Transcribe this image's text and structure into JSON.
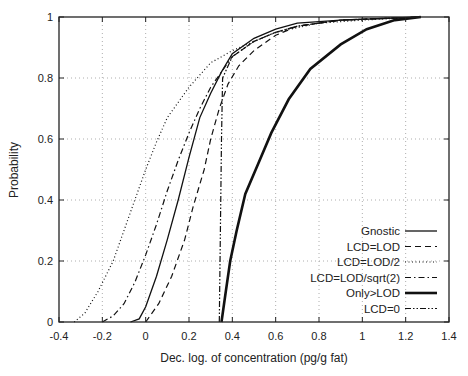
{
  "chart_data": {
    "type": "line",
    "title": "",
    "xlabel": "Dec. log. of concentration (pg/g fat)",
    "ylabel": "Probability",
    "xlim": [
      -0.4,
      1.4
    ],
    "ylim": [
      0,
      1
    ],
    "xticks": [
      "-0.4",
      "-0.2",
      "0",
      "0.2",
      "0.4",
      "0.6",
      "0.8",
      "1",
      "1.2",
      "1.4"
    ],
    "yticks": [
      "0",
      "0.2",
      "0.4",
      "0.6",
      "0.8",
      "1"
    ],
    "grid": true,
    "legend_position": "lower right",
    "series": [
      {
        "name": "Gnostic",
        "style": "solid",
        "width": 1.3,
        "points": [
          [
            -0.07,
            0
          ],
          [
            -0.03,
            0.01
          ],
          [
            0.0,
            0.05
          ],
          [
            0.05,
            0.15
          ],
          [
            0.1,
            0.27
          ],
          [
            0.15,
            0.4
          ],
          [
            0.2,
            0.54
          ],
          [
            0.25,
            0.67
          ],
          [
            0.3,
            0.75
          ],
          [
            0.35,
            0.82
          ],
          [
            0.4,
            0.88
          ],
          [
            0.5,
            0.93
          ],
          [
            0.6,
            0.96
          ],
          [
            0.7,
            0.98
          ],
          [
            0.9,
            0.99
          ],
          [
            1.27,
            1.0
          ]
        ]
      },
      {
        "name": "LCD=LOD",
        "style": "dashed",
        "width": 1.2,
        "points": [
          [
            0.0,
            0
          ],
          [
            0.02,
            0.02
          ],
          [
            0.06,
            0.06
          ],
          [
            0.12,
            0.15
          ],
          [
            0.18,
            0.27
          ],
          [
            0.22,
            0.38
          ],
          [
            0.27,
            0.5
          ],
          [
            0.3,
            0.6
          ],
          [
            0.34,
            0.7
          ],
          [
            0.38,
            0.78
          ],
          [
            0.43,
            0.84
          ],
          [
            0.5,
            0.89
          ],
          [
            0.6,
            0.94
          ],
          [
            0.7,
            0.97
          ],
          [
            0.9,
            0.99
          ],
          [
            1.27,
            1.0
          ]
        ]
      },
      {
        "name": "LCD=LOD/2",
        "style": "dotted",
        "width": 1.2,
        "points": [
          [
            -0.33,
            0
          ],
          [
            -0.28,
            0.03
          ],
          [
            -0.22,
            0.1
          ],
          [
            -0.15,
            0.2
          ],
          [
            -0.1,
            0.3
          ],
          [
            -0.05,
            0.4
          ],
          [
            0.0,
            0.5
          ],
          [
            0.05,
            0.59
          ],
          [
            0.1,
            0.67
          ],
          [
            0.2,
            0.77
          ],
          [
            0.3,
            0.85
          ],
          [
            0.4,
            0.89
          ],
          [
            0.5,
            0.92
          ],
          [
            0.6,
            0.95
          ],
          [
            0.8,
            0.98
          ],
          [
            1.0,
            0.99
          ],
          [
            1.27,
            1.0
          ]
        ]
      },
      {
        "name": "LCD=LOD/sqrt(2)",
        "style": "dashdot",
        "width": 1.2,
        "points": [
          [
            -0.2,
            0
          ],
          [
            -0.15,
            0.02
          ],
          [
            -0.1,
            0.06
          ],
          [
            -0.05,
            0.13
          ],
          [
            0.0,
            0.22
          ],
          [
            0.05,
            0.32
          ],
          [
            0.1,
            0.43
          ],
          [
            0.15,
            0.53
          ],
          [
            0.2,
            0.62
          ],
          [
            0.25,
            0.7
          ],
          [
            0.3,
            0.77
          ],
          [
            0.35,
            0.82
          ],
          [
            0.4,
            0.87
          ],
          [
            0.5,
            0.92
          ],
          [
            0.6,
            0.95
          ],
          [
            0.7,
            0.97
          ],
          [
            0.9,
            0.99
          ],
          [
            1.27,
            1.0
          ]
        ]
      },
      {
        "name": "Only>LOD",
        "style": "solid-thick",
        "width": 2.6,
        "points": [
          [
            0.35,
            0
          ],
          [
            0.37,
            0.1
          ],
          [
            0.39,
            0.2
          ],
          [
            0.42,
            0.3
          ],
          [
            0.46,
            0.42
          ],
          [
            0.52,
            0.52
          ],
          [
            0.58,
            0.62
          ],
          [
            0.66,
            0.73
          ],
          [
            0.76,
            0.83
          ],
          [
            0.9,
            0.91
          ],
          [
            1.02,
            0.96
          ],
          [
            1.15,
            0.99
          ],
          [
            1.27,
            1.0
          ]
        ]
      },
      {
        "name": "LCD=0",
        "style": "dashdotdot",
        "width": 1.2,
        "points": [
          [
            0.34,
            0
          ],
          [
            0.345,
            0.3
          ],
          [
            0.35,
            0.6
          ],
          [
            0.355,
            0.8
          ],
          [
            0.4,
            0.87
          ],
          [
            0.5,
            0.92
          ],
          [
            0.6,
            0.95
          ],
          [
            0.7,
            0.97
          ],
          [
            0.9,
            0.99
          ],
          [
            1.27,
            1.0
          ]
        ]
      }
    ]
  }
}
